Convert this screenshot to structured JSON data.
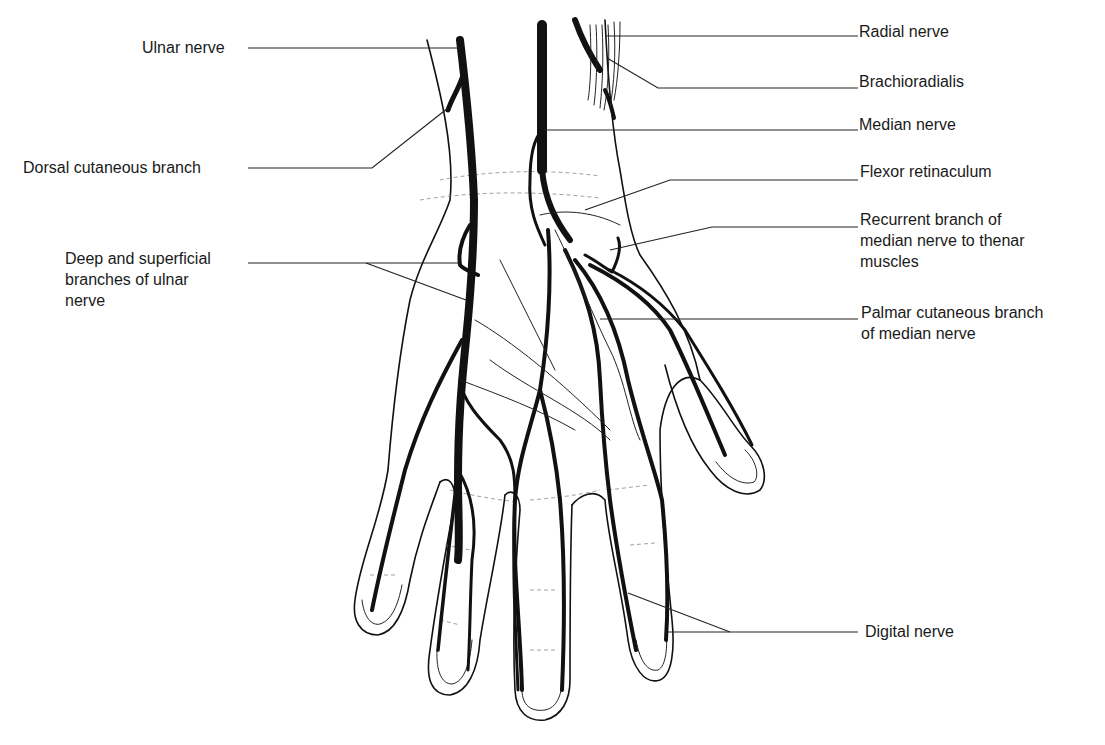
{
  "figure": {
    "labels_left": [
      {
        "id": "ulnar_nerve",
        "text": "Ulnar nerve"
      },
      {
        "id": "dorsal_cutaneous_branch",
        "text": "Dorsal cutaneous branch"
      },
      {
        "id": "deep_superficial_branches",
        "text": "Deep and superficial\nbranches of ulnar\nnerve"
      }
    ],
    "labels_right": [
      {
        "id": "radial_nerve",
        "text": "Radial nerve"
      },
      {
        "id": "brachioradialis",
        "text": "Brachioradialis"
      },
      {
        "id": "median_nerve",
        "text": "Median nerve"
      },
      {
        "id": "flexor_retinaculum",
        "text": "Flexor retinaculum"
      },
      {
        "id": "recurrent_branch",
        "text": "Recurrent branch of\nmedian nerve to thenar\nmuscles"
      },
      {
        "id": "palmar_cutaneous_branch",
        "text": "Palmar cutaneous branch\nof median nerve"
      },
      {
        "id": "digital_nerve",
        "text": "Digital nerve"
      }
    ],
    "colors": {
      "ink": "#111111",
      "background": "#ffffff"
    }
  }
}
